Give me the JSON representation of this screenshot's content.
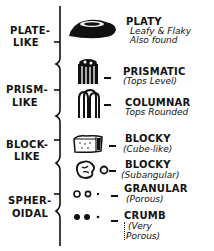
{
  "diagram": {
    "groups": [
      {
        "label_line1": "PLATE-",
        "label_line2": "LIKE",
        "types": [
          {
            "name": "PLATY",
            "desc1": "Leafy & Flaky",
            "desc2": "Also found",
            "icon": "platy-plate-icon"
          }
        ]
      },
      {
        "label_line1": "PRISM-",
        "label_line2": "LIKE",
        "types": [
          {
            "name": "PRISMATIC",
            "desc1": "(Tops Level)",
            "icon": "prismatic-columns-icon"
          },
          {
            "name": "COLUMNAR",
            "desc1": "Tops Rounded",
            "icon": "columnar-rounded-columns-icon"
          }
        ]
      },
      {
        "label_line1": "BLOCK-",
        "label_line2": "LIKE",
        "types": [
          {
            "name": "BLOCKY",
            "desc1": "(Cube-like)",
            "icon": "blocky-cube-icon"
          },
          {
            "name": "BLOCKY",
            "desc1": "(Subangular)",
            "icon": "blocky-subangular-icon"
          }
        ]
      },
      {
        "label_line1": "SPHER-",
        "label_line2": "OIDAL",
        "types": [
          {
            "name": "GRANULAR",
            "desc1": "(Porous)",
            "icon": "granular-dots-icon"
          },
          {
            "name": "CRUMB",
            "desc1": "(Very",
            "desc2": "Porous)",
            "icon": "crumb-dots-icon"
          }
        ]
      }
    ],
    "colors": {
      "ink": "#111111",
      "paper": "#ffffff"
    }
  }
}
